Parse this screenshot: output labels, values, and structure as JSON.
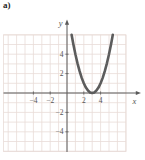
{
  "figure_label": "a)",
  "chart_data": {
    "type": "line",
    "title": "",
    "equation": "y = (x - 3)^2",
    "vertex": [
      3,
      0
    ],
    "x_axis_label": "x",
    "y_axis_label": "y",
    "x_tick_values": [
      -4,
      -2,
      2,
      4
    ],
    "x_tick_labels": [
      "−4",
      "−2",
      "2",
      "4"
    ],
    "y_tick_values": [
      4,
      2,
      -2,
      -4
    ],
    "y_tick_labels": [
      "4",
      "2",
      "−2",
      "−4"
    ],
    "xlim": [
      -7.6,
      7.0
    ],
    "ylim": [
      -6,
      6
    ],
    "grid": true,
    "colors": {
      "grid": "#e9dcd8",
      "axis": "#5a5a5a",
      "curve": "#5c5c5c",
      "tick_label": "#555555"
    },
    "series": [
      {
        "name": "parabola",
        "points": [
          [
            0.55,
            6.0
          ],
          [
            0.75,
            5.06
          ],
          [
            1,
            4
          ],
          [
            1.25,
            3.06
          ],
          [
            1.5,
            2.25
          ],
          [
            1.75,
            1.56
          ],
          [
            2,
            1
          ],
          [
            2.25,
            0.56
          ],
          [
            2.5,
            0.25
          ],
          [
            2.75,
            0.06
          ],
          [
            3,
            0
          ],
          [
            3.25,
            0.06
          ],
          [
            3.5,
            0.25
          ],
          [
            3.75,
            0.56
          ],
          [
            4,
            1
          ],
          [
            4.25,
            1.56
          ],
          [
            4.5,
            2.25
          ],
          [
            4.75,
            3.06
          ],
          [
            5,
            4
          ],
          [
            5.25,
            5.06
          ],
          [
            5.45,
            6.0
          ]
        ]
      }
    ]
  }
}
